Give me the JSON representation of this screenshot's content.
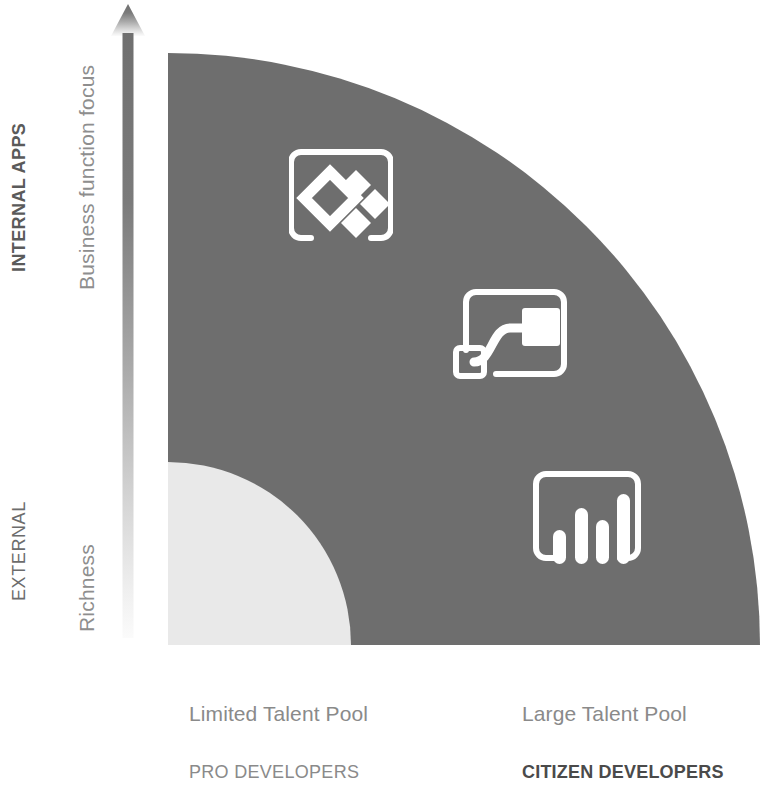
{
  "diagram": {
    "type": "quadrant-diagram"
  },
  "y_axis": {
    "category_top": "INTERNAL APPS",
    "category_bottom": "EXTERNAL",
    "measure_top": "Business function focus",
    "measure_bottom": "Richness",
    "arrow": "up-arrow-icon",
    "direction": "up"
  },
  "x_axis": {
    "left": {
      "pool_label": "Limited Talent Pool",
      "developer_label": "PRO DEVELOPERS"
    },
    "right": {
      "pool_label": "Large Talent Pool",
      "developer_label": "CITIZEN DEVELOPERS"
    }
  },
  "regions": {
    "primary": {
      "name": "large-quarter-circle",
      "color": "#6e6e6e"
    },
    "secondary": {
      "name": "small-quarter-circle",
      "color": "#e9e9e9"
    }
  },
  "icons": [
    {
      "id": "power-apps",
      "name": "power-apps-icon",
      "color": "#ffffff"
    },
    {
      "id": "power-automate",
      "name": "power-automate-icon",
      "color": "#ffffff"
    },
    {
      "id": "power-bi",
      "name": "power-bi-icon",
      "color": "#ffffff"
    }
  ],
  "colors": {
    "dark_fill": "#6e6e6e",
    "light_fill": "#e9e9e9",
    "arrow_top": "#6f6f6f",
    "arrow_bottom": "#fafafa",
    "text_muted": "#8a8a8a",
    "text_strong": "#4a4a4a",
    "background": "#ffffff"
  }
}
